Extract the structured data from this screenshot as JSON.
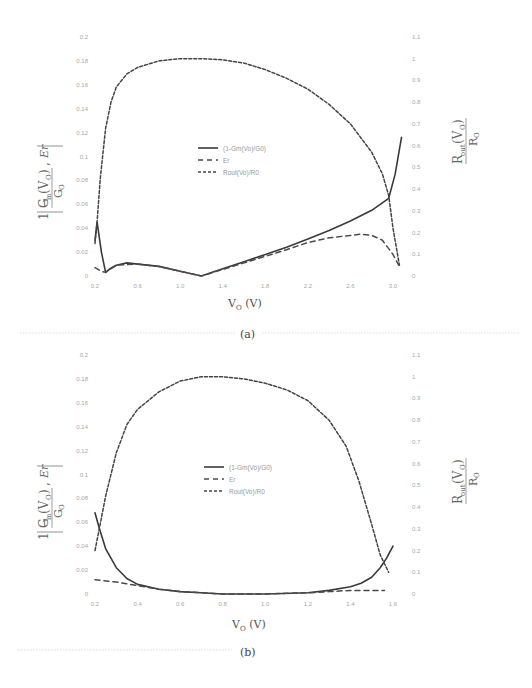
{
  "chart_data": [
    {
      "type": "line",
      "panel": "a",
      "caption": "(a)",
      "title": "",
      "xlabel": "VO (V)",
      "ylabel_left": "|1 - Gm(VO)/GO|, Er",
      "ylabel_right": "Rout(VO)/RO",
      "xlim": [
        0.2,
        3.1
      ],
      "ylim_left": [
        0,
        0.2
      ],
      "ylim_right": [
        0,
        1.1
      ],
      "x_ticks": [
        "0.2",
        "0.6",
        "1.0",
        "1.4",
        "1.8",
        "2.2",
        "2.6",
        "3.0"
      ],
      "y_ticks_left": [
        "0",
        "0.02",
        "0.04",
        "0.06",
        "0.08",
        "0.1",
        "0.12",
        "0.14",
        "0.16",
        "0.18",
        "0.2"
      ],
      "y_ticks_right": [
        "0",
        "0.1",
        "0.2",
        "0.3",
        "0.4",
        "0.5",
        "0.6",
        "0.7",
        "0.8",
        "0.9",
        "1",
        "1.1"
      ],
      "grid": false,
      "legend_position": "center",
      "series": [
        {
          "name": "(1-Gm(Vo)/G0)",
          "style": "solid",
          "axis": "left",
          "x": [
            0.2,
            0.22,
            0.26,
            0.3,
            0.34,
            0.4,
            0.5,
            0.6,
            0.8,
            1.0,
            1.2,
            1.4,
            1.6,
            1.8,
            2.0,
            2.2,
            2.4,
            2.6,
            2.8,
            2.96,
            3.02,
            3.08
          ],
          "values": [
            0.03,
            0.045,
            0.02,
            0.003,
            0.006,
            0.009,
            0.011,
            0.01,
            0.008,
            0.004,
            0.0,
            0.006,
            0.012,
            0.018,
            0.024,
            0.031,
            0.038,
            0.046,
            0.055,
            0.065,
            0.085,
            0.116
          ]
        },
        {
          "name": "Er",
          "style": "dashed",
          "axis": "left",
          "x": [
            0.2,
            0.26,
            0.3,
            0.4,
            0.6,
            0.8,
            1.0,
            1.2,
            1.6,
            2.0,
            2.2,
            2.4,
            2.6,
            2.7,
            2.8,
            2.9,
            3.0,
            3.06
          ],
          "values": [
            0.007,
            0.004,
            0.003,
            0.009,
            0.01,
            0.008,
            0.004,
            0.0,
            0.011,
            0.022,
            0.028,
            0.032,
            0.034,
            0.035,
            0.034,
            0.03,
            0.018,
            0.008
          ]
        },
        {
          "name": "Rout(Vo)/R0",
          "style": "dotted",
          "axis": "right",
          "x": [
            0.2,
            0.22,
            0.25,
            0.3,
            0.35,
            0.4,
            0.5,
            0.6,
            0.8,
            1.0,
            1.2,
            1.4,
            1.6,
            1.8,
            2.0,
            2.2,
            2.4,
            2.6,
            2.8,
            2.9,
            2.96,
            3.0,
            3.06
          ],
          "values": [
            0.15,
            0.25,
            0.45,
            0.68,
            0.8,
            0.87,
            0.93,
            0.96,
            0.99,
            1.0,
            1.0,
            0.995,
            0.98,
            0.95,
            0.91,
            0.86,
            0.79,
            0.7,
            0.57,
            0.47,
            0.37,
            0.22,
            0.05
          ]
        }
      ]
    },
    {
      "type": "line",
      "panel": "b",
      "caption": "(b)",
      "title": "",
      "xlabel": "VO (V)",
      "ylabel_left": "|1 - Gm(VO)/GO|, Er",
      "ylabel_right": "Rout(VO)/RO",
      "xlim": [
        0.2,
        1.6
      ],
      "ylim_left": [
        0,
        0.2
      ],
      "ylim_right": [
        0,
        1.1
      ],
      "x_ticks": [
        "0.2",
        "0.4",
        "0.6",
        "0.8",
        "1.0",
        "1.2",
        "1.4",
        "1.6"
      ],
      "y_ticks_left": [
        "0",
        "0.02",
        "0.04",
        "0.06",
        "0.08",
        "0.1",
        "0.12",
        "0.14",
        "0.16",
        "0.18",
        "0.2"
      ],
      "y_ticks_right": [
        "0",
        "0.1",
        "0.2",
        "0.3",
        "0.4",
        "0.5",
        "0.6",
        "0.7",
        "0.8",
        "0.9",
        "1",
        "1.1"
      ],
      "grid": false,
      "legend_position": "center",
      "series": [
        {
          "name": "(1-Gm(Vo)/G0)",
          "style": "solid",
          "axis": "left",
          "x": [
            0.2,
            0.22,
            0.25,
            0.3,
            0.35,
            0.4,
            0.5,
            0.6,
            0.7,
            0.8,
            1.0,
            1.2,
            1.3,
            1.4,
            1.45,
            1.5,
            1.54,
            1.57,
            1.6
          ],
          "values": [
            0.068,
            0.055,
            0.038,
            0.022,
            0.013,
            0.008,
            0.004,
            0.002,
            0.001,
            0.0,
            0.0,
            0.001,
            0.003,
            0.006,
            0.009,
            0.014,
            0.022,
            0.03,
            0.04
          ]
        },
        {
          "name": "Er",
          "style": "dashed",
          "axis": "left",
          "x": [
            0.2,
            0.3,
            0.4,
            0.5,
            0.6,
            0.8,
            1.0,
            1.2,
            1.3,
            1.4,
            1.5,
            1.56
          ],
          "values": [
            0.012,
            0.01,
            0.007,
            0.004,
            0.002,
            0.0,
            0.0,
            0.001,
            0.002,
            0.003,
            0.003,
            0.003
          ]
        },
        {
          "name": "Rout(Vo)/R0",
          "style": "dotted",
          "axis": "right",
          "x": [
            0.2,
            0.22,
            0.25,
            0.3,
            0.35,
            0.4,
            0.5,
            0.6,
            0.7,
            0.8,
            0.9,
            1.0,
            1.1,
            1.2,
            1.3,
            1.38,
            1.44,
            1.5,
            1.54,
            1.58
          ],
          "values": [
            0.2,
            0.3,
            0.45,
            0.65,
            0.78,
            0.85,
            0.93,
            0.98,
            1.0,
            1.0,
            0.99,
            0.97,
            0.94,
            0.89,
            0.8,
            0.68,
            0.52,
            0.32,
            0.18,
            0.1
          ]
        }
      ]
    }
  ],
  "figure": {
    "panels": [
      {
        "caption": "(a)"
      },
      {
        "caption": "(b)"
      }
    ],
    "legend_labels": [
      "(1-Gm(Vo)/G0)",
      "Er",
      "Rout(Vo)/R0"
    ],
    "xlabel_main": "V",
    "xlabel_sub": "O",
    "xlabel_unit": " (V)"
  }
}
